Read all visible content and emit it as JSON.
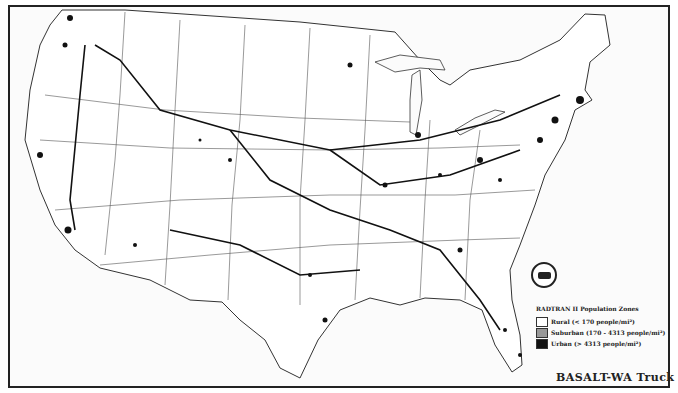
{
  "map": {
    "title": "BASALT-WA Truck",
    "region": "Contiguous United States",
    "legend": {
      "title": "RADTRAN II Population Zones",
      "items": [
        {
          "label": "Rural (< 170 people/mi²)",
          "color": "#ffffff"
        },
        {
          "label": "Suburban (170 - 4313 people/mi²)",
          "color": "#999999"
        },
        {
          "label": "Urban (> 4313 people/mi²)",
          "color": "#111111"
        }
      ]
    },
    "seal": "agency-seal-icon",
    "colors": {
      "border": "#222222",
      "route": "#111111",
      "state_lines": "#444444",
      "background": "#fbfbfb"
    }
  }
}
